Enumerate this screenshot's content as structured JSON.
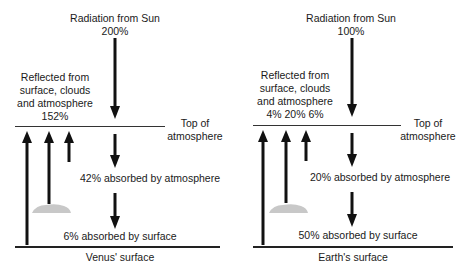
{
  "venus": {
    "radiation_title": "Radiation from Sun",
    "radiation_value": "200%",
    "reflected_line1": "Reflected from",
    "reflected_line2": "surface, clouds",
    "reflected_line3": "and atmosphere",
    "reflected_value": "152%",
    "top_line1": "Top of",
    "top_line2": "atmosphere",
    "absorbed_atmosphere": "42% absorbed by atmosphere",
    "absorbed_surface": "6% absorbed by surface",
    "surface_label": "Venus' surface"
  },
  "earth": {
    "radiation_title": "Radiation from Sun",
    "radiation_value": "100%",
    "reflected_line1": "Reflected from",
    "reflected_line2": "surface, clouds",
    "reflected_line3": "and atmosphere",
    "reflected_value": "4% 20% 6%",
    "top_line1": "Top of",
    "top_line2": "atmosphere",
    "absorbed_atmosphere": "20% absorbed by atmosphere",
    "absorbed_surface": "50% absorbed by surface",
    "surface_label": "Earth's surface"
  },
  "colors": {
    "arrow": "#111111",
    "cloud": "#c8c8c8",
    "line": "#333333"
  }
}
